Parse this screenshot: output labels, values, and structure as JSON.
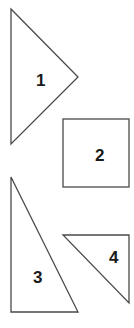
{
  "diagram": {
    "shapes": [
      {
        "id": "1",
        "type": "triangle",
        "label": "1",
        "points": "11,9 78,77 11,144",
        "label_pos": [
          42,
          86
        ]
      },
      {
        "id": "2",
        "type": "square",
        "label": "2",
        "x": 63,
        "y": 119,
        "w": 66,
        "h": 68,
        "label_pos": [
          100,
          161
        ]
      },
      {
        "id": "3",
        "type": "triangle",
        "label": "3",
        "points": "11,177 11,312 78,312",
        "label_pos": [
          38,
          283
        ]
      },
      {
        "id": "4",
        "type": "triangle",
        "label": "4",
        "points": "63,235 129,235 129,303",
        "label_pos": [
          114,
          263
        ]
      }
    ],
    "colors": {
      "stroke": "#4a4a4a",
      "fill": "#ffffff",
      "text": "#1a1a1a"
    }
  }
}
